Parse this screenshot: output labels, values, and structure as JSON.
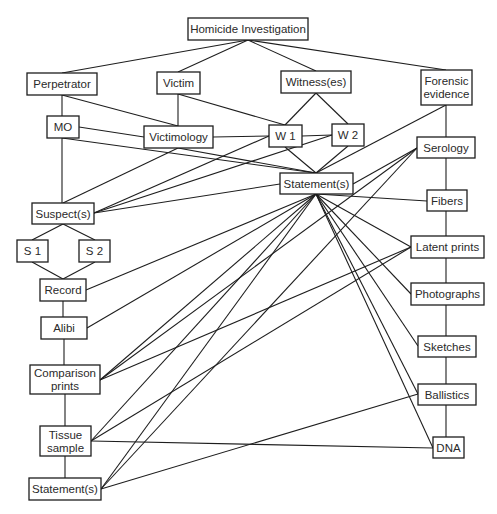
{
  "diagram": {
    "title": "Homicide Investigation",
    "nodes": [
      {
        "id": "homicide",
        "lines": [
          "Homicide Investigation"
        ],
        "x": 188,
        "y": 18,
        "w": 120,
        "h": 22
      },
      {
        "id": "perpetrator",
        "lines": [
          "Perpetrator"
        ],
        "x": 27,
        "y": 73,
        "w": 70,
        "h": 22
      },
      {
        "id": "victim",
        "lines": [
          "Victim"
        ],
        "x": 157,
        "y": 72,
        "w": 43,
        "h": 22
      },
      {
        "id": "witnesses",
        "lines": [
          "Witness(es)"
        ],
        "x": 281,
        "y": 71,
        "w": 70,
        "h": 22
      },
      {
        "id": "forensic",
        "lines": [
          "Forensic",
          "evidence"
        ],
        "x": 421,
        "y": 70,
        "w": 51,
        "h": 35
      },
      {
        "id": "mo",
        "lines": [
          "MO"
        ],
        "x": 47,
        "y": 116,
        "w": 32,
        "h": 22
      },
      {
        "id": "victimology",
        "lines": [
          "Victimology"
        ],
        "x": 144,
        "y": 126,
        "w": 69,
        "h": 22
      },
      {
        "id": "w1",
        "lines": [
          "W 1"
        ],
        "x": 269,
        "y": 125,
        "w": 33,
        "h": 22
      },
      {
        "id": "w2",
        "lines": [
          "W 2"
        ],
        "x": 332,
        "y": 124,
        "w": 32,
        "h": 22
      },
      {
        "id": "statement_mid",
        "lines": [
          "Statement(s)"
        ],
        "x": 280,
        "y": 173,
        "w": 73,
        "h": 21
      },
      {
        "id": "serology",
        "lines": [
          "Serology"
        ],
        "x": 417,
        "y": 137,
        "w": 58,
        "h": 21
      },
      {
        "id": "suspects",
        "lines": [
          "Suspect(s)"
        ],
        "x": 32,
        "y": 203,
        "w": 62,
        "h": 21
      },
      {
        "id": "fibers",
        "lines": [
          "Fibers"
        ],
        "x": 427,
        "y": 190,
        "w": 40,
        "h": 21
      },
      {
        "id": "s1",
        "lines": [
          "S 1"
        ],
        "x": 17,
        "y": 240,
        "w": 31,
        "h": 22
      },
      {
        "id": "s2",
        "lines": [
          "S 2"
        ],
        "x": 79,
        "y": 240,
        "w": 31,
        "h": 22
      },
      {
        "id": "latent",
        "lines": [
          "Latent prints"
        ],
        "x": 411,
        "y": 236,
        "w": 73,
        "h": 22
      },
      {
        "id": "record",
        "lines": [
          "Record"
        ],
        "x": 40,
        "y": 279,
        "w": 46,
        "h": 22
      },
      {
        "id": "photographs",
        "lines": [
          "Photographs"
        ],
        "x": 411,
        "y": 283,
        "w": 73,
        "h": 22
      },
      {
        "id": "alibi",
        "lines": [
          "Alibi"
        ],
        "x": 41,
        "y": 317,
        "w": 46,
        "h": 22
      },
      {
        "id": "sketches",
        "lines": [
          "Sketches"
        ],
        "x": 418,
        "y": 336,
        "w": 58,
        "h": 21
      },
      {
        "id": "comparison",
        "lines": [
          "Comparison",
          "prints"
        ],
        "x": 30,
        "y": 365,
        "w": 70,
        "h": 29
      },
      {
        "id": "ballistics",
        "lines": [
          "Ballistics"
        ],
        "x": 418,
        "y": 384,
        "w": 58,
        "h": 21
      },
      {
        "id": "tissue",
        "lines": [
          "Tissue",
          "sample"
        ],
        "x": 40,
        "y": 426,
        "w": 51,
        "h": 30
      },
      {
        "id": "dna",
        "lines": [
          "DNA"
        ],
        "x": 433,
        "y": 437,
        "w": 31,
        "h": 21
      },
      {
        "id": "statement_bottom",
        "lines": [
          "Statement(s)"
        ],
        "x": 29,
        "y": 478,
        "w": 72,
        "h": 22
      }
    ],
    "edges": [
      [
        248,
        40,
        62,
        73
      ],
      [
        248,
        40,
        178,
        72
      ],
      [
        248,
        40,
        316,
        71
      ],
      [
        248,
        40,
        446,
        70
      ],
      [
        62,
        95,
        62,
        116
      ],
      [
        62,
        95,
        178,
        126
      ],
      [
        178,
        94,
        178,
        126
      ],
      [
        178,
        94,
        285,
        125
      ],
      [
        316,
        93,
        285,
        125
      ],
      [
        316,
        93,
        348,
        124
      ],
      [
        79,
        127,
        144,
        137
      ],
      [
        213,
        137,
        269,
        136
      ],
      [
        302,
        136,
        332,
        135
      ],
      [
        62,
        138,
        62,
        203
      ],
      [
        62,
        138,
        316,
        173
      ],
      [
        178,
        148,
        316,
        173
      ],
      [
        178,
        148,
        63,
        203
      ],
      [
        94,
        213,
        269,
        136
      ],
      [
        94,
        213,
        332,
        135
      ],
      [
        94,
        213,
        280,
        184
      ],
      [
        285,
        147,
        316,
        173
      ],
      [
        348,
        146,
        316,
        173
      ],
      [
        446,
        105,
        316,
        173
      ],
      [
        446,
        105,
        446,
        137
      ],
      [
        353,
        184,
        417,
        148
      ],
      [
        446,
        158,
        446,
        190
      ],
      [
        446,
        211,
        446,
        236
      ],
      [
        446,
        258,
        446,
        283
      ],
      [
        446,
        305,
        446,
        336
      ],
      [
        446,
        357,
        446,
        384
      ],
      [
        446,
        405,
        446,
        437
      ],
      [
        316,
        194,
        427,
        201
      ],
      [
        316,
        194,
        411,
        247
      ],
      [
        316,
        194,
        411,
        294
      ],
      [
        316,
        194,
        418,
        346
      ],
      [
        316,
        194,
        418,
        394
      ],
      [
        316,
        194,
        433,
        448
      ],
      [
        316,
        194,
        86,
        290
      ],
      [
        316,
        194,
        87,
        328
      ],
      [
        316,
        194,
        100,
        380
      ],
      [
        316,
        194,
        91,
        441
      ],
      [
        316,
        194,
        101,
        489
      ],
      [
        63,
        224,
        32,
        240
      ],
      [
        63,
        224,
        95,
        240
      ],
      [
        32,
        262,
        63,
        279
      ],
      [
        95,
        262,
        63,
        279
      ],
      [
        63,
        301,
        63,
        317
      ],
      [
        64,
        339,
        64,
        365
      ],
      [
        65,
        394,
        65,
        426
      ],
      [
        65,
        456,
        65,
        478
      ],
      [
        417,
        148,
        100,
        380
      ],
      [
        417,
        148,
        101,
        489
      ],
      [
        411,
        247,
        100,
        380
      ],
      [
        411,
        247,
        91,
        441
      ],
      [
        91,
        441,
        433,
        448
      ],
      [
        418,
        394,
        101,
        489
      ]
    ]
  }
}
